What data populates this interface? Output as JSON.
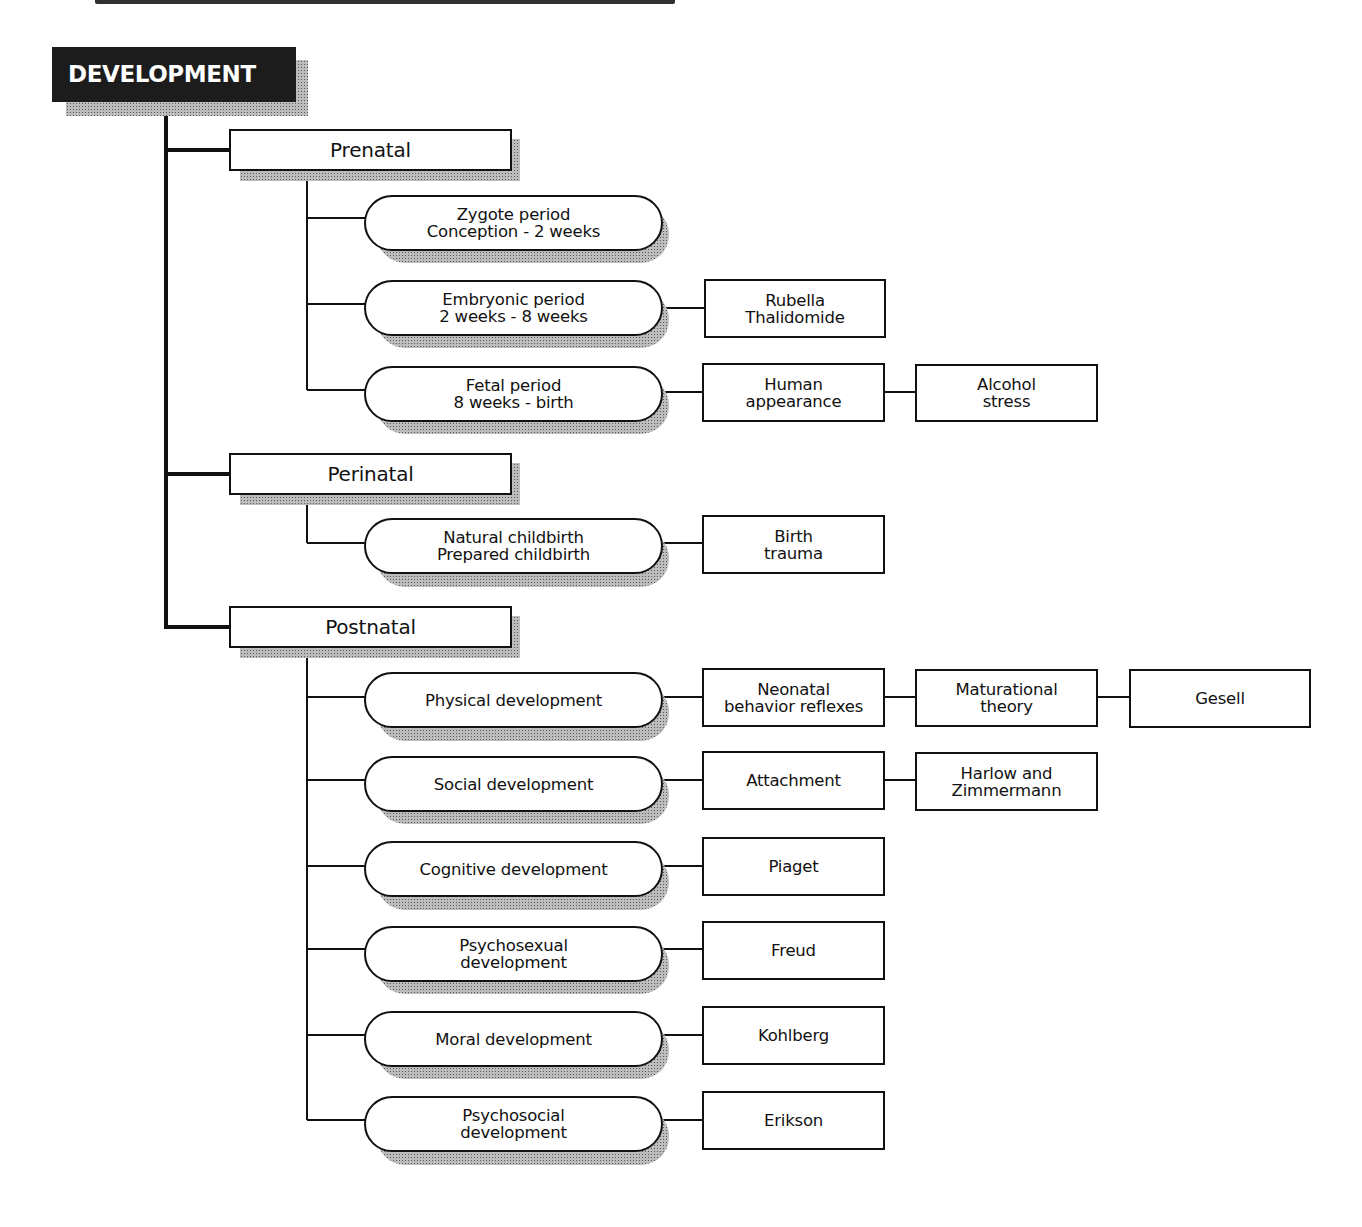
{
  "title_cut": "",
  "root": {
    "label": "DEVELOPMENT"
  },
  "stages": [
    {
      "label": "Prenatal",
      "periods": [
        {
          "label": "Zygote period\nConception - 2 weeks",
          "chain": []
        },
        {
          "label": "Embryonic period\n2 weeks - 8 weeks",
          "chain": [
            "Rubella\nThalidomide"
          ]
        },
        {
          "label": "Fetal period\n8 weeks - birth",
          "chain": [
            "Human\nappearance",
            "Alcohol\nstress"
          ]
        }
      ]
    },
    {
      "label": "Perinatal",
      "periods": [
        {
          "label": "Natural childbirth\nPrepared childbirth",
          "chain": [
            "Birth\ntrauma"
          ]
        }
      ]
    },
    {
      "label": "Postnatal",
      "periods": [
        {
          "label": "Physical development",
          "chain": [
            "Neonatal\nbehavior reflexes",
            "Maturational\ntheory",
            "Gesell"
          ]
        },
        {
          "label": "Social development",
          "chain": [
            "Attachment",
            "Harlow and\nZimmermann"
          ]
        },
        {
          "label": "Cognitive development",
          "chain": [
            "Piaget"
          ]
        },
        {
          "label": "Psychosexual\ndevelopment",
          "chain": [
            "Freud"
          ]
        },
        {
          "label": "Moral development",
          "chain": [
            "Kohlberg"
          ]
        },
        {
          "label": "Psychosocial\ndevelopment",
          "chain": [
            "Erikson"
          ]
        }
      ]
    }
  ],
  "colors": {
    "line": "#111111",
    "root_bg": "#1c1c1c",
    "root_text": "#ffffff",
    "shadow": "#9a9a9a",
    "background": "#ffffff"
  }
}
